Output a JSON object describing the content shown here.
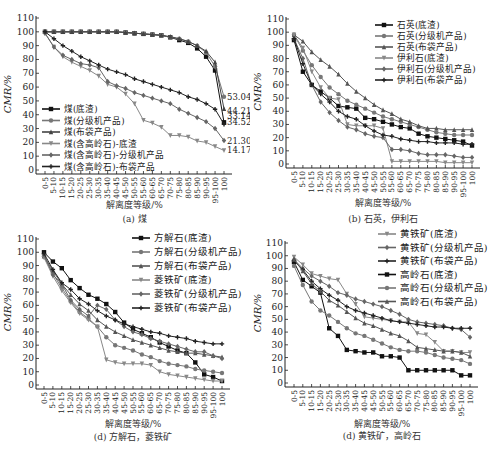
{
  "categories": [
    "0-5",
    "5-10",
    "10-15",
    "15-20",
    "20-25",
    "25-30",
    "30-35",
    "35-40",
    "40-45",
    "45-50",
    "50-55",
    "55-60",
    "60-65",
    "65-70",
    "70-75",
    "75-80",
    "80-85",
    "85-90",
    "90-95",
    "95-100",
    "100"
  ],
  "chart_data": [
    {
      "id": "a",
      "type": "line",
      "caption": "(a) 煤",
      "xlabel": "解离度等级/%",
      "ylabel": "CMR/%",
      "ylim": [
        0,
        110
      ],
      "yticks": [
        0,
        10,
        20,
        30,
        40,
        50,
        60,
        70,
        80,
        90,
        100,
        110
      ],
      "legend_position": "lower-left",
      "series": [
        {
          "name": "煤(底渣)",
          "marker": "square",
          "color": "#111111",
          "values": [
            100,
            100,
            100,
            100,
            100,
            100,
            100,
            100,
            100,
            99.5,
            99,
            98.5,
            98,
            97.5,
            96,
            94,
            92,
            88,
            82,
            72,
            34.52
          ]
        },
        {
          "name": "煤(分级机产品)",
          "marker": "circle",
          "color": "#777777",
          "values": [
            100,
            100,
            100,
            100,
            100,
            100,
            100,
            100,
            100,
            99.5,
            99,
            98.5,
            98,
            97.5,
            96,
            95,
            93,
            90,
            85,
            75,
            53.04
          ]
        },
        {
          "name": "煤(布袋产品)",
          "marker": "triangle",
          "color": "#444444",
          "values": [
            100,
            100,
            100,
            100,
            100,
            100,
            100,
            100,
            100,
            99.5,
            99,
            98.5,
            98,
            97.5,
            96.5,
            95,
            93,
            90,
            86,
            78,
            44.21
          ]
        },
        {
          "name": "煤(含高岭石)-底渣",
          "marker": "tri-down",
          "color": "#888888",
          "values": [
            99,
            89,
            82,
            78,
            75,
            72,
            68,
            62,
            60,
            55,
            48,
            36,
            34,
            31,
            25,
            25,
            24,
            21,
            20,
            17,
            14.17
          ]
        },
        {
          "name": "煤(含高岭石)-分级机产品",
          "marker": "diamond",
          "color": "#666666",
          "values": [
            99,
            89,
            83,
            80,
            77,
            76,
            74,
            64,
            61,
            59,
            56,
            54,
            52,
            50,
            48,
            44,
            41,
            38,
            35,
            30,
            21.3
          ]
        },
        {
          "name": "煤(含高岭石)-布袋产品",
          "marker": "star",
          "color": "#222222",
          "values": [
            100,
            95,
            90,
            86,
            82,
            79,
            76,
            73,
            71,
            69,
            66,
            64,
            62,
            60,
            58,
            56,
            53,
            51,
            48,
            44,
            33.14
          ]
        }
      ],
      "annotations": [
        "53.04",
        "44.21",
        "33.14",
        "34.52",
        "21.30",
        "14.17"
      ]
    },
    {
      "id": "b",
      "type": "line",
      "caption": "(b) 石英，伊利石",
      "xlabel": "解离度等级/%",
      "ylabel": "CMR/%",
      "ylim": [
        0,
        110
      ],
      "yticks": [
        0,
        10,
        20,
        30,
        40,
        50,
        60,
        70,
        80,
        90,
        100,
        110
      ],
      "legend_position": "upper-right",
      "series": [
        {
          "name": "石英(底渣)",
          "marker": "square",
          "color": "#111111",
          "values": [
            94,
            70,
            60,
            55,
            50,
            44,
            43,
            42,
            35,
            34,
            32,
            30,
            28,
            27,
            23,
            21,
            20,
            19,
            18,
            17,
            14
          ]
        },
        {
          "name": "石英(分级机产品)",
          "marker": "circle",
          "color": "#777777",
          "values": [
            98,
            86,
            75,
            66,
            58,
            53,
            48,
            45,
            42,
            39,
            36,
            34,
            32,
            30,
            28,
            26,
            24,
            23,
            22,
            22,
            22
          ]
        },
        {
          "name": "石英(布袋产品)",
          "marker": "triangle",
          "color": "#555555",
          "values": [
            98,
            93,
            85,
            79,
            74,
            68,
            61,
            55,
            50,
            45,
            41,
            38,
            34,
            32,
            29,
            27,
            27,
            26,
            26,
            26,
            26
          ]
        },
        {
          "name": "伊利石(底渣)",
          "marker": "tri-down",
          "color": "#888888",
          "values": [
            98,
            88,
            70,
            58,
            50,
            49,
            30,
            29,
            29,
            29,
            27,
            2,
            2,
            2,
            2,
            2,
            2,
            1,
            1,
            1,
            1
          ]
        },
        {
          "name": "伊利石(分级机产品)",
          "marker": "diamond",
          "color": "#666666",
          "values": [
            95,
            80,
            60,
            47,
            39,
            33,
            28,
            26,
            23,
            21,
            20,
            11,
            11,
            10,
            8,
            7,
            7,
            7,
            6,
            5,
            5
          ]
        },
        {
          "name": "伊利石(布袋产品)",
          "marker": "star",
          "color": "#222222",
          "values": [
            95,
            76,
            60,
            53,
            47,
            40,
            36,
            34,
            29,
            25,
            22,
            21,
            19,
            18,
            17,
            17,
            16,
            16,
            16,
            15,
            15
          ]
        }
      ]
    },
    {
      "id": "c",
      "type": "line",
      "caption": "(d) 方解石，菱铁矿",
      "xlabel": "解离度等级/%",
      "ylabel": "CMR/%",
      "ylim": [
        0,
        110
      ],
      "yticks": [
        0,
        10,
        20,
        30,
        40,
        50,
        60,
        70,
        80,
        90,
        100,
        110
      ],
      "legend_position": "upper-right",
      "series": [
        {
          "name": "方解石(底渣)",
          "marker": "square",
          "color": "#111111",
          "values": [
            100,
            93,
            88,
            79,
            73,
            68,
            65,
            61,
            55,
            47,
            42,
            39,
            36,
            32,
            29,
            26,
            24,
            17,
            8,
            6,
            3
          ]
        },
        {
          "name": "方解石(分级机产品)",
          "marker": "circle",
          "color": "#777777",
          "values": [
            97,
            84,
            73,
            63,
            55,
            50,
            44,
            36,
            30,
            28,
            26,
            23,
            21,
            18,
            16,
            15,
            14,
            12,
            11,
            10,
            9
          ]
        },
        {
          "name": "方解石(布袋产品)",
          "marker": "triangle",
          "color": "#555555",
          "values": [
            97,
            86,
            76,
            68,
            61,
            56,
            49,
            44,
            40,
            37,
            34,
            32,
            30,
            28,
            26,
            25,
            24,
            24,
            23,
            22,
            21
          ]
        },
        {
          "name": "菱铁矿(底渣)",
          "marker": "tri-down",
          "color": "#888888",
          "values": [
            96,
            82,
            71,
            62,
            54,
            49,
            44,
            19,
            17,
            16,
            16,
            16,
            15,
            10,
            8,
            7,
            6,
            5,
            4,
            3,
            3
          ]
        },
        {
          "name": "菱铁矿(分级机产品)",
          "marker": "diamond",
          "color": "#666666",
          "values": [
            98,
            83,
            76,
            64,
            57,
            52,
            60,
            57,
            49,
            44,
            40,
            38,
            35,
            33,
            31,
            29,
            27,
            25,
            25,
            22,
            20
          ]
        },
        {
          "name": "菱铁矿(布袋产品)",
          "marker": "star",
          "color": "#222222",
          "values": [
            99,
            87,
            77,
            72,
            65,
            61,
            56,
            52,
            49,
            46,
            44,
            42,
            40,
            39,
            37,
            36,
            35,
            33,
            32,
            31,
            31
          ]
        }
      ]
    },
    {
      "id": "d",
      "type": "line",
      "caption": "(d) 黄铁矿，高岭石",
      "xlabel": "解离度等级/%",
      "ylabel": "CMR/%",
      "ylim": [
        0,
        110
      ],
      "yticks": [
        0,
        10,
        20,
        30,
        40,
        50,
        60,
        70,
        80,
        90,
        100,
        110
      ],
      "legend_position": "upper-right",
      "series": [
        {
          "name": "黄铁矿(底渣)",
          "marker": "tri-down",
          "color": "#888888",
          "values": [
            99,
            93,
            86,
            84,
            82,
            81,
            70,
            62,
            52,
            51,
            50,
            49,
            48,
            48,
            39,
            38,
            32,
            25,
            25,
            24,
            24
          ]
        },
        {
          "name": "黄铁矿(分级机产品)",
          "marker": "diamond",
          "color": "#666666",
          "values": [
            97,
            90,
            84,
            80,
            76,
            71,
            69,
            66,
            64,
            62,
            60,
            57,
            54,
            50,
            48,
            47,
            46,
            45,
            43,
            42,
            36
          ]
        },
        {
          "name": "黄铁矿(布袋产品)",
          "marker": "star",
          "color": "#222222",
          "values": [
            96,
            89,
            80,
            74,
            69,
            65,
            60,
            57,
            55,
            53,
            51,
            49,
            48,
            47,
            46,
            45,
            44,
            44,
            43,
            43,
            43
          ]
        },
        {
          "name": "高岭石(底渣)",
          "marker": "square",
          "color": "#111111",
          "values": [
            95,
            81,
            76,
            71,
            43,
            37,
            26,
            25,
            24,
            24,
            21,
            21,
            20,
            10,
            10,
            10,
            10,
            10,
            10,
            6,
            6
          ]
        },
        {
          "name": "高岭石(分级机产品)",
          "marker": "circle",
          "color": "#777777",
          "values": [
            92,
            77,
            64,
            57,
            53,
            48,
            43,
            39,
            37,
            34,
            31,
            28,
            26,
            25,
            25,
            24,
            22,
            20,
            19,
            18,
            15
          ]
        },
        {
          "name": "高岭石(布袋产品)",
          "marker": "triangle",
          "color": "#555555",
          "values": [
            97,
            88,
            78,
            72,
            65,
            61,
            56,
            51,
            47,
            45,
            42,
            39,
            37,
            33,
            28,
            27,
            26,
            25,
            25,
            24,
            21
          ]
        }
      ]
    }
  ]
}
